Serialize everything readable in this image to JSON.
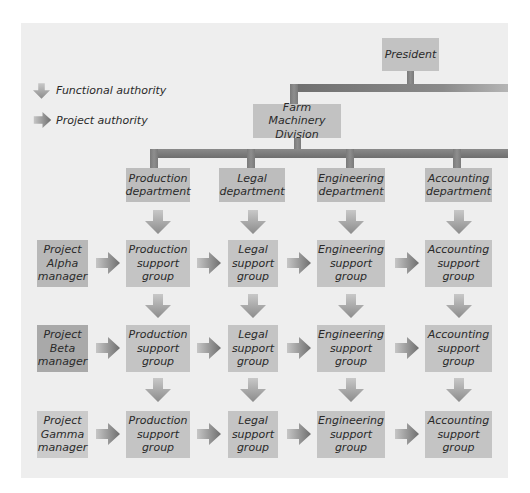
{
  "legend": {
    "functional_label": "Functional authority",
    "project_label": "Project authority"
  },
  "top": {
    "president": "President",
    "division": "Farm Machinery\nDivision"
  },
  "departments": [
    {
      "label": "Production\ndepartment"
    },
    {
      "label": "Legal\ndepartment"
    },
    {
      "label": "Engineering\ndepartment"
    },
    {
      "label": "Accounting\ndepartment"
    }
  ],
  "projects": [
    {
      "manager": "Project\nAlpha\nmanager",
      "color": "#b8b8b8",
      "groups": [
        "Production\nsupport\ngroup",
        "Legal\nsupport\ngroup",
        "Engineering\nsupport\ngroup",
        "Accounting\nsupport\ngroup"
      ]
    },
    {
      "manager": "Project\nBeta\nmanager",
      "color": "#a9a9a9",
      "groups": [
        "Production\nsupport\ngroup",
        "Legal\nsupport\ngroup",
        "Engineering\nsupport\ngroup",
        "Accounting\nsupport\ngroup"
      ]
    },
    {
      "manager": "Project\nGamma\nmanager",
      "color": "#cbcbcb",
      "groups": [
        "Production\nsupport\ngroup",
        "Legal\nsupport\ngroup",
        "Engineering\nsupport\ngroup",
        "Accounting\nsupport\ngroup"
      ]
    }
  ],
  "colors": {
    "panel": "#eeeeee",
    "box": "#c2c2c2",
    "connector": "#7a7a7a"
  }
}
